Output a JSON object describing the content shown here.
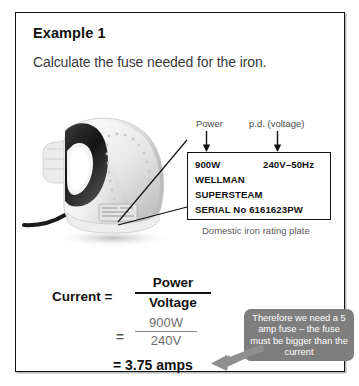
{
  "panel": {
    "title": "Example 1",
    "question": "Calculate the fuse needed for the iron."
  },
  "figure": {
    "iron_alt": "Domestic steam iron photograph",
    "caption": "Domestic iron rating plate",
    "labels": {
      "power": "Power",
      "pd_voltage": "p.d. (voltage)"
    }
  },
  "rating_plate": {
    "power": "900W",
    "voltage": "240V–50Hz",
    "brand": "WELLMAN",
    "model": "SUPERSTEAM",
    "serial": "SERIAL No 6161623PW"
  },
  "equation": {
    "current_label": "Current =",
    "symbolic": {
      "numerator": "Power",
      "denominator": "Voltage"
    },
    "equals": "=",
    "numeric": {
      "numerator": "900W",
      "denominator": "240V"
    },
    "result": "= 3.75 amps"
  },
  "callout": {
    "text": "Therefore we need a 5 amp fuse – the fuse must be bigger than the current"
  },
  "colors": {
    "border": "#111111",
    "callout_bg": "#7e7e7e",
    "callout_text": "#ffffff",
    "muted_text": "#5a5a5a",
    "arrow_grey": "#8f8f8f"
  }
}
